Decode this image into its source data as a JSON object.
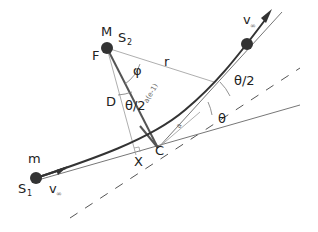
{
  "diagram": {
    "labels": {
      "M": "M",
      "S2_main": "S",
      "S2_sub": "2",
      "F": "F",
      "phi": "φ",
      "r": "r",
      "D": "D",
      "theta_half_left": "θ/2",
      "a_e_minus_1": "a(e-1)",
      "a": "a",
      "theta_half_right": "θ/2",
      "theta": "θ",
      "C": "C",
      "X": "X",
      "m": "m",
      "S1_main": "S",
      "S1_sub": "1",
      "v_inf_in_main": "v",
      "v_inf_in_sub": "∞",
      "v_inf_out_main": "v",
      "v_inf_out_sub": "∞"
    },
    "colors": {
      "trajectory": "#333333",
      "thin_line": "#777777",
      "dashed_line": "#555555",
      "body": "#333333"
    }
  }
}
